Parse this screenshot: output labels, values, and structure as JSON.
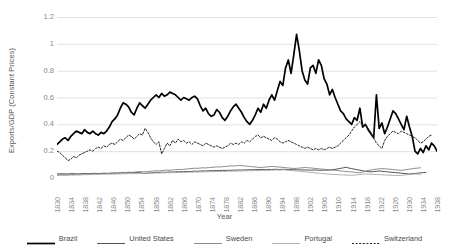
{
  "chart_data": {
    "type": "line",
    "title": "",
    "xlabel": "Year",
    "ylabel": "Exports/GDP (Constant Prices)",
    "ylim": [
      0,
      1.2
    ],
    "ytick_values": [
      0,
      0.2,
      0.4,
      0.6,
      0.8,
      1,
      1.2
    ],
    "ytick_labels": [
      "0",
      "0.2",
      "0.4",
      "0.6",
      "0.8",
      "1",
      "1.2"
    ],
    "grid": true,
    "legend_position": "bottom",
    "x_start": 1830,
    "x_end": 1938,
    "xtick_labels": [
      "1830",
      "1834",
      "1838",
      "1842",
      "1846",
      "1850",
      "1854",
      "1858",
      "1862",
      "1866",
      "1870",
      "1874",
      "1878",
      "1882",
      "1886",
      "1890",
      "1894",
      "1898",
      "1902",
      "1906",
      "1910",
      "1914",
      "1918",
      "1922",
      "1926",
      "1930",
      "1934",
      "1938"
    ],
    "series": [
      {
        "name": "Brazil",
        "color": "#000000",
        "width": 1.7,
        "dash": "none",
        "values": [
          0.25,
          0.27,
          0.29,
          0.3,
          0.28,
          0.31,
          0.33,
          0.35,
          0.34,
          0.33,
          0.36,
          0.34,
          0.33,
          0.35,
          0.33,
          0.32,
          0.34,
          0.33,
          0.35,
          0.38,
          0.42,
          0.44,
          0.47,
          0.52,
          0.56,
          0.55,
          0.53,
          0.49,
          0.47,
          0.52,
          0.56,
          0.54,
          0.52,
          0.55,
          0.58,
          0.6,
          0.62,
          0.6,
          0.63,
          0.61,
          0.62,
          0.64,
          0.63,
          0.62,
          0.6,
          0.58,
          0.6,
          0.59,
          0.58,
          0.6,
          0.61,
          0.59,
          0.54,
          0.5,
          0.52,
          0.48,
          0.46,
          0.47,
          0.51,
          0.49,
          0.45,
          0.43,
          0.46,
          0.5,
          0.53,
          0.55,
          0.52,
          0.49,
          0.45,
          0.42,
          0.4,
          0.43,
          0.47,
          0.52,
          0.49,
          0.55,
          0.52,
          0.58,
          0.62,
          0.58,
          0.65,
          0.72,
          0.69,
          0.82,
          0.88,
          0.78,
          0.92,
          1.07,
          0.95,
          0.8,
          0.73,
          0.7,
          0.82,
          0.84,
          0.78,
          0.88,
          0.84,
          0.74,
          0.7,
          0.62,
          0.66,
          0.6,
          0.55,
          0.5,
          0.48,
          0.44,
          0.42,
          0.4,
          0.45,
          0.43,
          0.52,
          0.38,
          0.4,
          0.36,
          0.33,
          0.3,
          0.62,
          0.37,
          0.41,
          0.33,
          0.38,
          0.44,
          0.5,
          0.48,
          0.44,
          0.4,
          0.36,
          0.46,
          0.38,
          0.31,
          0.2,
          0.18,
          0.22,
          0.19,
          0.24,
          0.21,
          0.26,
          0.24,
          0.2
        ]
      },
      {
        "name": "United States",
        "color": "#3f3f3f",
        "width": 0.9,
        "dash": "none",
        "values": [
          0.03,
          0.031,
          0.032,
          0.031,
          0.03,
          0.032,
          0.033,
          0.031,
          0.03,
          0.032,
          0.034,
          0.033,
          0.032,
          0.034,
          0.035,
          0.033,
          0.034,
          0.036,
          0.035,
          0.034,
          0.036,
          0.037,
          0.036,
          0.038,
          0.039,
          0.038,
          0.04,
          0.039,
          0.038,
          0.04,
          0.041,
          0.035,
          0.033,
          0.036,
          0.038,
          0.04,
          0.042,
          0.041,
          0.043,
          0.042,
          0.044,
          0.045,
          0.044,
          0.046,
          0.047,
          0.046,
          0.048,
          0.049,
          0.048,
          0.05,
          0.051,
          0.05,
          0.052,
          0.053,
          0.052,
          0.054,
          0.055,
          0.054,
          0.056,
          0.055,
          0.057,
          0.056,
          0.058,
          0.057,
          0.059,
          0.058,
          0.06,
          0.059,
          0.061,
          0.06,
          0.062,
          0.061,
          0.063,
          0.062,
          0.064,
          0.063,
          0.062,
          0.064,
          0.063,
          0.065,
          0.064,
          0.063,
          0.065,
          0.064,
          0.062,
          0.063,
          0.061,
          0.062,
          0.06,
          0.061,
          0.059,
          0.06,
          0.058,
          0.059,
          0.06,
          0.058,
          0.057,
          0.059,
          0.058,
          0.06,
          0.062,
          0.065,
          0.068,
          0.072,
          0.076,
          0.08,
          0.074,
          0.07,
          0.066,
          0.062,
          0.058,
          0.054,
          0.05,
          0.048,
          0.046,
          0.048,
          0.05,
          0.052,
          0.05,
          0.048,
          0.046,
          0.044,
          0.042,
          0.04,
          0.038,
          0.036,
          0.034,
          0.032,
          0.03,
          0.032,
          0.034,
          0.036,
          0.038,
          0.04,
          0.042
        ]
      },
      {
        "name": "Sweden",
        "color": "#7f7f7f",
        "width": 0.9,
        "dash": "none",
        "values": [
          0.022,
          0.023,
          0.024,
          0.023,
          0.025,
          0.026,
          0.025,
          0.027,
          0.028,
          0.027,
          0.029,
          0.03,
          0.029,
          0.031,
          0.032,
          0.031,
          0.033,
          0.034,
          0.033,
          0.035,
          0.037,
          0.036,
          0.038,
          0.04,
          0.042,
          0.041,
          0.043,
          0.042,
          0.044,
          0.046,
          0.048,
          0.047,
          0.046,
          0.048,
          0.05,
          0.052,
          0.054,
          0.053,
          0.055,
          0.057,
          0.059,
          0.058,
          0.06,
          0.062,
          0.064,
          0.063,
          0.065,
          0.067,
          0.069,
          0.071,
          0.073,
          0.072,
          0.074,
          0.076,
          0.075,
          0.077,
          0.079,
          0.081,
          0.083,
          0.082,
          0.084,
          0.086,
          0.088,
          0.09,
          0.089,
          0.091,
          0.093,
          0.092,
          0.09,
          0.088,
          0.086,
          0.084,
          0.082,
          0.08,
          0.078,
          0.08,
          0.082,
          0.084,
          0.086,
          0.085,
          0.083,
          0.081,
          0.079,
          0.077,
          0.075,
          0.073,
          0.071,
          0.072,
          0.074,
          0.076,
          0.078,
          0.077,
          0.075,
          0.073,
          0.071,
          0.069,
          0.067,
          0.065,
          0.063,
          0.061,
          0.059,
          0.057,
          0.055,
          0.053,
          0.051,
          0.049,
          0.047,
          0.045,
          0.043,
          0.041,
          0.039,
          0.044,
          0.05,
          0.056,
          0.06,
          0.063,
          0.066,
          0.068,
          0.07,
          0.069,
          0.067,
          0.065,
          0.063,
          0.061,
          0.059,
          0.057,
          0.06,
          0.063,
          0.066,
          0.069,
          0.072,
          0.074,
          0.076
        ]
      },
      {
        "name": "Portugal",
        "color": "#a6a6a6",
        "width": 0.9,
        "dash": "none",
        "values": [
          0.018,
          0.019,
          0.02,
          0.019,
          0.021,
          0.022,
          0.021,
          0.023,
          0.022,
          0.024,
          0.025,
          0.024,
          0.026,
          0.025,
          0.027,
          0.026,
          0.028,
          0.027,
          0.029,
          0.028,
          0.03,
          0.029,
          0.031,
          0.03,
          0.032,
          0.031,
          0.033,
          0.032,
          0.034,
          0.033,
          0.035,
          0.034,
          0.036,
          0.035,
          0.037,
          0.036,
          0.038,
          0.037,
          0.039,
          0.038,
          0.04,
          0.039,
          0.041,
          0.04,
          0.042,
          0.041,
          0.043,
          0.042,
          0.044,
          0.043,
          0.045,
          0.044,
          0.046,
          0.045,
          0.047,
          0.046,
          0.048,
          0.047,
          0.049,
          0.048,
          0.05,
          0.049,
          0.051,
          0.05,
          0.052,
          0.051,
          0.053,
          0.052,
          0.054,
          0.053,
          0.055,
          0.054,
          0.056,
          0.055,
          0.057,
          0.056,
          0.058,
          0.057,
          0.059,
          0.058,
          0.06,
          0.059,
          0.061,
          0.06,
          0.058,
          0.056,
          0.054,
          0.052,
          0.05,
          0.048,
          0.046,
          0.044,
          0.042,
          0.04,
          0.038,
          0.036,
          0.034,
          0.032,
          0.03,
          0.028,
          0.027,
          0.026,
          0.025,
          0.024,
          0.023,
          0.022,
          0.021,
          0.02,
          0.022,
          0.024,
          0.026,
          0.028,
          0.03,
          0.029,
          0.028,
          0.027,
          0.026,
          0.025,
          0.024,
          0.023,
          0.022,
          0.021,
          0.02,
          0.019,
          0.018,
          0.02,
          0.022,
          0.024,
          0.026,
          0.028,
          0.03,
          0.029,
          0.028
        ]
      },
      {
        "name": "Switzerland",
        "color": "#262626",
        "width": 1.0,
        "dash": "2,1.6",
        "values": [
          0.2,
          0.19,
          0.17,
          0.15,
          0.13,
          0.14,
          0.16,
          0.15,
          0.17,
          0.18,
          0.19,
          0.2,
          0.21,
          0.2,
          0.22,
          0.23,
          0.22,
          0.24,
          0.23,
          0.25,
          0.26,
          0.25,
          0.27,
          0.29,
          0.28,
          0.3,
          0.32,
          0.31,
          0.29,
          0.31,
          0.33,
          0.32,
          0.37,
          0.34,
          0.3,
          0.27,
          0.25,
          0.27,
          0.18,
          0.22,
          0.26,
          0.24,
          0.28,
          0.26,
          0.29,
          0.27,
          0.28,
          0.26,
          0.27,
          0.25,
          0.27,
          0.26,
          0.25,
          0.24,
          0.26,
          0.25,
          0.24,
          0.23,
          0.24,
          0.23,
          0.22,
          0.23,
          0.24,
          0.26,
          0.25,
          0.26,
          0.25,
          0.27,
          0.26,
          0.28,
          0.27,
          0.29,
          0.31,
          0.32,
          0.3,
          0.31,
          0.3,
          0.29,
          0.28,
          0.3,
          0.29,
          0.27,
          0.26,
          0.27,
          0.28,
          0.27,
          0.26,
          0.25,
          0.24,
          0.23,
          0.22,
          0.23,
          0.22,
          0.21,
          0.22,
          0.21,
          0.22,
          0.21,
          0.22,
          0.23,
          0.22,
          0.23,
          0.24,
          0.26,
          0.28,
          0.3,
          0.32,
          0.35,
          0.38,
          0.4,
          0.42,
          0.39,
          0.4,
          0.37,
          0.34,
          0.3,
          0.26,
          0.24,
          0.22,
          0.28,
          0.31,
          0.33,
          0.35,
          0.34,
          0.33,
          0.35,
          0.34,
          0.33,
          0.32,
          0.31,
          0.3,
          0.28,
          0.26,
          0.27,
          0.29,
          0.31,
          0.32
        ]
      }
    ]
  }
}
